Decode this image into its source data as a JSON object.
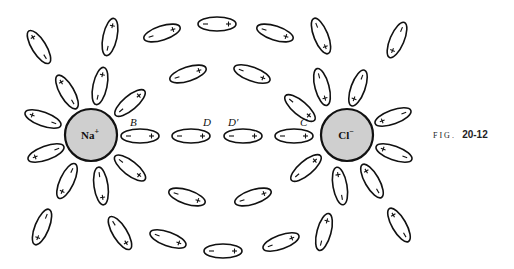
{
  "figure": {
    "caption_prefix": "FIG.",
    "caption_number": "20-12",
    "ions": [
      {
        "id": "na",
        "label": "Na",
        "charge": "+",
        "cx": 91,
        "cy": 135,
        "r": 26,
        "fill": "#cfcfcf"
      },
      {
        "id": "cl",
        "label": "Cl",
        "charge": "−",
        "cx": 347,
        "cy": 135,
        "r": 26,
        "fill": "#cfcfcf"
      }
    ],
    "point_labels": [
      {
        "text": "B",
        "x": 130,
        "y": 126
      },
      {
        "text": "D",
        "x": 203,
        "y": 126
      },
      {
        "text": "D′",
        "x": 228,
        "y": 126
      },
      {
        "text": "C",
        "x": 300,
        "y": 126
      }
    ],
    "dipole_size": {
      "rx": 19,
      "ry": 7
    },
    "dipoles": [
      {
        "cx": 140,
        "cy": 136,
        "angle": 0
      },
      {
        "cx": 191,
        "cy": 136,
        "angle": 0
      },
      {
        "cx": 243,
        "cy": 136,
        "angle": 0
      },
      {
        "cx": 294,
        "cy": 136,
        "angle": 0
      },
      {
        "cx": 67,
        "cy": 92,
        "angle": -120
      },
      {
        "cx": 100,
        "cy": 86,
        "angle": -78
      },
      {
        "cx": 130,
        "cy": 103,
        "angle": -40
      },
      {
        "cx": 43,
        "cy": 119,
        "angle": -160
      },
      {
        "cx": 46,
        "cy": 153,
        "angle": 160
      },
      {
        "cx": 67,
        "cy": 181,
        "angle": 115
      },
      {
        "cx": 101,
        "cy": 186,
        "angle": 82
      },
      {
        "cx": 130,
        "cy": 168,
        "angle": 38
      },
      {
        "cx": 39,
        "cy": 47,
        "angle": -122
      },
      {
        "cx": 110,
        "cy": 37,
        "angle": -78
      },
      {
        "cx": 42,
        "cy": 227,
        "angle": 112
      },
      {
        "cx": 120,
        "cy": 233,
        "angle": 58
      },
      {
        "cx": 162,
        "cy": 33,
        "angle": -18
      },
      {
        "cx": 217,
        "cy": 24,
        "angle": 0
      },
      {
        "cx": 275,
        "cy": 33,
        "angle": 18
      },
      {
        "cx": 188,
        "cy": 74,
        "angle": -18
      },
      {
        "cx": 252,
        "cy": 74,
        "angle": 20
      },
      {
        "cx": 187,
        "cy": 197,
        "angle": 18
      },
      {
        "cx": 253,
        "cy": 197,
        "angle": -18
      },
      {
        "cx": 168,
        "cy": 239,
        "angle": 20
      },
      {
        "cx": 223,
        "cy": 251,
        "angle": 0
      },
      {
        "cx": 281,
        "cy": 242,
        "angle": -20
      },
      {
        "cx": 322,
        "cy": 87,
        "angle": 75
      },
      {
        "cx": 300,
        "cy": 108,
        "angle": 40
      },
      {
        "cx": 358,
        "cy": 88,
        "angle": 110
      },
      {
        "cx": 393,
        "cy": 117,
        "angle": 160
      },
      {
        "cx": 394,
        "cy": 153,
        "angle": -160
      },
      {
        "cx": 306,
        "cy": 168,
        "angle": -40
      },
      {
        "cx": 340,
        "cy": 186,
        "angle": -100
      },
      {
        "cx": 372,
        "cy": 181,
        "angle": -120
      },
      {
        "cx": 321,
        "cy": 36,
        "angle": 68
      },
      {
        "cx": 397,
        "cy": 40,
        "angle": 113
      },
      {
        "cx": 324,
        "cy": 232,
        "angle": -75
      },
      {
        "cx": 399,
        "cy": 225,
        "angle": -120
      }
    ]
  }
}
